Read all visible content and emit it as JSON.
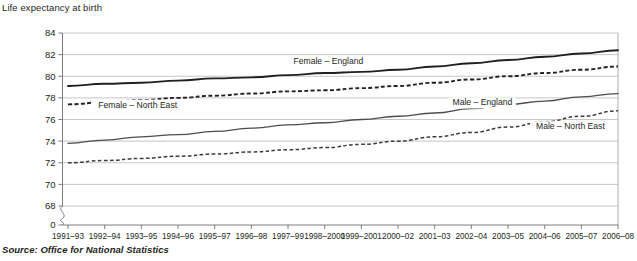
{
  "chart_title": "Life expectancy at birth",
  "source": "Source: Office for National Statistics",
  "chart_data": {
    "type": "line",
    "title": "Life expectancy at birth",
    "xlabel": "",
    "ylabel": "",
    "ylim": [
      68,
      84
    ],
    "yticks": [
      0,
      68,
      70,
      72,
      74,
      76,
      78,
      80,
      82,
      84
    ],
    "ytick_labels": [
      "0",
      "68",
      "70",
      "72",
      "74",
      "76",
      "78",
      "80",
      "82",
      "84"
    ],
    "axis_break": true,
    "grid": true,
    "legend_position": "inline-labels",
    "categories": [
      "1991–93",
      "1992–94",
      "1993–95",
      "1994–96",
      "1995–97",
      "1996–98",
      "1997–99",
      "1998–2000",
      "1999–2001",
      "2000–02",
      "2001–03",
      "2002–04",
      "2003–05",
      "2004–06",
      "2005–07",
      "2006–08"
    ],
    "series": [
      {
        "name": "Female – England",
        "style": "solid",
        "values": [
          79.1,
          79.3,
          79.4,
          79.6,
          79.8,
          79.9,
          80.1,
          80.3,
          80.4,
          80.6,
          80.9,
          81.2,
          81.5,
          81.8,
          82.1,
          82.4
        ]
      },
      {
        "name": "Female – North East",
        "style": "dashed",
        "values": [
          77.4,
          77.6,
          77.8,
          78.0,
          78.2,
          78.4,
          78.6,
          78.7,
          78.9,
          79.1,
          79.4,
          79.7,
          80.0,
          80.3,
          80.6,
          80.9
        ]
      },
      {
        "name": "Male – England",
        "style": "solid",
        "values": [
          73.8,
          74.1,
          74.4,
          74.6,
          74.9,
          75.2,
          75.5,
          75.7,
          76.0,
          76.3,
          76.6,
          77.0,
          77.4,
          77.7,
          78.1,
          78.4
        ]
      },
      {
        "name": "Male – North East",
        "style": "dashed",
        "values": [
          72.0,
          72.2,
          72.4,
          72.6,
          72.8,
          73.0,
          73.2,
          73.4,
          73.7,
          74.0,
          74.4,
          74.8,
          75.3,
          75.8,
          76.3,
          76.8
        ]
      }
    ],
    "series_label_positions": [
      {
        "name": "Female – England",
        "x_index": 7.1,
        "y_value": 81.1
      },
      {
        "name": "Female – North East",
        "x_index": 1.9,
        "y_value": 77.1
      },
      {
        "name": "Male – England",
        "x_index": 11.3,
        "y_value": 77.3
      },
      {
        "name": "Male – North East",
        "x_index": 13.7,
        "y_value": 75.1
      }
    ]
  }
}
